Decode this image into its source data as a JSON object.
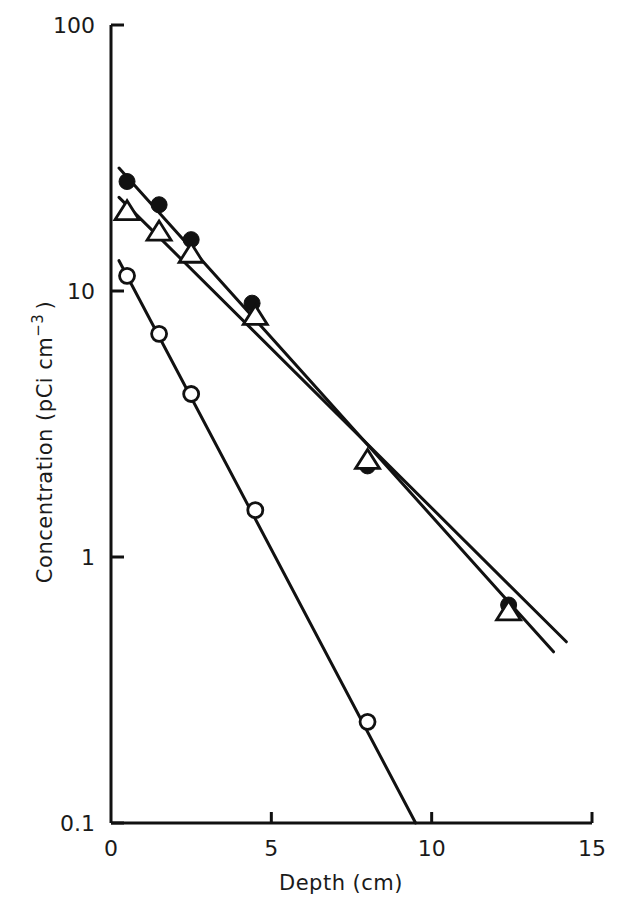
{
  "chart_data": {
    "type": "scatter",
    "title": "",
    "xlabel": "Depth (cm)",
    "ylabel": "Concentration (pCi cm⁻³)",
    "ylabel_main": "Concentration (pCi cm",
    "ylabel_sup": "−3",
    "ylabel_close": ")",
    "xlim": [
      0,
      15
    ],
    "ylim": [
      0.1,
      100
    ],
    "yscale": "log",
    "grid": false,
    "legend": null,
    "x_ticks": [
      0,
      5,
      10,
      15
    ],
    "x_tick_labels": [
      "0",
      "5",
      "10",
      "15"
    ],
    "y_ticks": [
      0.1,
      1,
      10,
      100
    ],
    "y_tick_labels": [
      "0.1",
      "1",
      "10",
      "100"
    ],
    "series": [
      {
        "name": "filled circles",
        "marker": "filled-circle",
        "x": [
          0.5,
          1.5,
          2.5,
          4.4,
          8.0,
          12.4
        ],
        "y": [
          25.8,
          21.1,
          15.6,
          9.0,
          2.2,
          0.66
        ],
        "fit_line": {
          "x": [
            0.25,
            13.8
          ],
          "y": [
            29.0,
            0.44
          ]
        }
      },
      {
        "name": "open triangles",
        "marker": "open-triangle",
        "x": [
          0.5,
          1.5,
          2.5,
          4.5,
          8.0,
          12.4
        ],
        "y": [
          19.8,
          16.6,
          13.7,
          8.0,
          2.3,
          0.62
        ],
        "fit_line": {
          "x": [
            0.25,
            14.2
          ],
          "y": [
            22.5,
            0.48
          ]
        }
      },
      {
        "name": "open circles",
        "marker": "open-circle",
        "x": [
          0.5,
          1.5,
          2.5,
          4.5,
          8.0
        ],
        "y": [
          11.4,
          6.9,
          4.1,
          1.5,
          0.24
        ],
        "fit_line": {
          "x": [
            0.25,
            9.5
          ],
          "y": [
            13.0,
            0.1
          ]
        }
      }
    ]
  }
}
